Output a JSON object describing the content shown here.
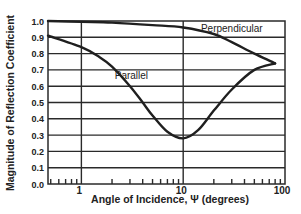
{
  "chart_data": {
    "type": "line",
    "title": "",
    "xlabel": "Angle of Incidence, Ψ (degrees)",
    "ylabel": "Magnitude of Reflection Coefficient",
    "xscale": "log",
    "xlim": [
      0.47,
      100
    ],
    "ylim": [
      0.0,
      1.0
    ],
    "grid": true,
    "x_tick_labels": [
      "1",
      "10",
      "100"
    ],
    "x_ticks": [
      1,
      10,
      100
    ],
    "y_tick_labels": [
      "0.0",
      "0.1",
      "0.2",
      "0.3",
      "0.4",
      "0.5",
      "0.6",
      "0.7",
      "0.8",
      "0.9",
      "1.0"
    ],
    "y_ticks": [
      0.0,
      0.1,
      0.2,
      0.3,
      0.4,
      0.5,
      0.6,
      0.7,
      0.8,
      0.9,
      1.0
    ],
    "legend": null,
    "annotations": [
      {
        "text": "Perpendicular",
        "x": 30,
        "y": 0.96
      },
      {
        "text": "Parallel",
        "x": 3.1,
        "y": 0.67
      }
    ],
    "series": [
      {
        "name": "Perpendicular",
        "x": [
          0.47,
          1,
          2,
          5,
          10,
          20,
          30,
          50,
          80
        ],
        "values": [
          1.0,
          0.995,
          0.99,
          0.975,
          0.96,
          0.92,
          0.87,
          0.8,
          0.74
        ]
      },
      {
        "name": "Parallel",
        "x": [
          0.47,
          1,
          1.5,
          2,
          3,
          4,
          5,
          7,
          10,
          14,
          20,
          30,
          50,
          80
        ],
        "values": [
          0.91,
          0.84,
          0.78,
          0.72,
          0.6,
          0.5,
          0.42,
          0.32,
          0.28,
          0.33,
          0.45,
          0.58,
          0.7,
          0.74
        ]
      }
    ]
  }
}
